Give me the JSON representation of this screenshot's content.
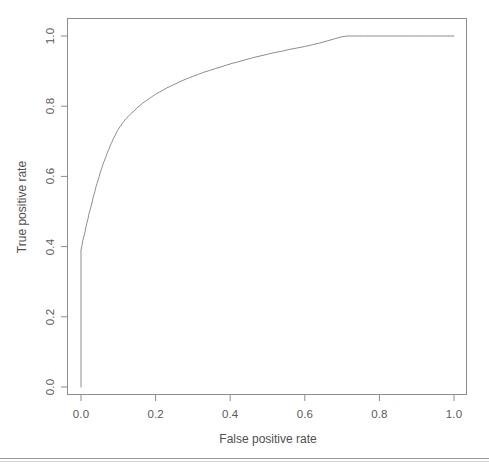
{
  "chart_data": {
    "type": "line",
    "title": "",
    "xlabel": "False positive rate",
    "ylabel": "True positive rate",
    "xlim": [
      0.0,
      1.0
    ],
    "ylim": [
      0.0,
      1.0
    ],
    "grid": false,
    "legend": null,
    "xticks": [
      "0.0",
      "0.2",
      "0.4",
      "0.6",
      "0.8",
      "1.0"
    ],
    "xtick_values": [
      0.0,
      0.2,
      0.4,
      0.6,
      0.8,
      1.0
    ],
    "yticks": [
      "0.0",
      "0.2",
      "0.4",
      "0.6",
      "0.8",
      "1.0"
    ],
    "ytick_values": [
      0.0,
      0.2,
      0.4,
      0.6,
      0.8,
      1.0
    ],
    "series": [
      {
        "name": "ROC curve",
        "color": "#8d8d8d",
        "line_width": 1,
        "x": [
          0.0,
          0.0,
          0.003,
          0.005,
          0.008,
          0.011,
          0.013,
          0.016,
          0.019,
          0.021,
          0.024,
          0.027,
          0.03,
          0.032,
          0.035,
          0.038,
          0.04,
          0.043,
          0.046,
          0.049,
          0.051,
          0.054,
          0.057,
          0.059,
          0.062,
          0.065,
          0.068,
          0.07,
          0.073,
          0.076,
          0.078,
          0.081,
          0.084,
          0.086,
          0.089,
          0.092,
          0.095,
          0.097,
          0.1,
          0.105,
          0.11,
          0.115,
          0.12,
          0.126,
          0.131,
          0.136,
          0.142,
          0.15,
          0.158,
          0.166,
          0.174,
          0.182,
          0.19,
          0.2,
          0.21,
          0.22,
          0.23,
          0.24,
          0.252,
          0.264,
          0.276,
          0.288,
          0.3,
          0.315,
          0.33,
          0.345,
          0.36,
          0.375,
          0.39,
          0.405,
          0.42,
          0.44,
          0.46,
          0.48,
          0.5,
          0.52,
          0.54,
          0.56,
          0.58,
          0.6,
          0.62,
          0.64,
          0.66,
          0.68,
          0.7,
          0.715,
          0.76,
          0.82,
          0.88,
          0.94,
          1.0
        ],
        "y": [
          0.0,
          0.39,
          0.405,
          0.418,
          0.43,
          0.443,
          0.455,
          0.468,
          0.48,
          0.492,
          0.503,
          0.515,
          0.527,
          0.538,
          0.549,
          0.56,
          0.57,
          0.58,
          0.59,
          0.6,
          0.609,
          0.618,
          0.627,
          0.635,
          0.643,
          0.651,
          0.659,
          0.666,
          0.673,
          0.68,
          0.687,
          0.694,
          0.7,
          0.706,
          0.712,
          0.718,
          0.724,
          0.729,
          0.734,
          0.742,
          0.75,
          0.757,
          0.764,
          0.77,
          0.776,
          0.781,
          0.786,
          0.795,
          0.802,
          0.809,
          0.815,
          0.821,
          0.827,
          0.834,
          0.84,
          0.846,
          0.852,
          0.857,
          0.863,
          0.869,
          0.875,
          0.88,
          0.885,
          0.891,
          0.897,
          0.902,
          0.907,
          0.912,
          0.917,
          0.922,
          0.926,
          0.932,
          0.938,
          0.943,
          0.948,
          0.953,
          0.957,
          0.962,
          0.966,
          0.97,
          0.975,
          0.98,
          0.986,
          0.992,
          0.998,
          1.0,
          1.0,
          1.0,
          1.0,
          1.0,
          1.0
        ]
      }
    ]
  },
  "axes": {
    "x_title": "False positive rate",
    "y_title": "True positive rate",
    "x_tick_labels": [
      "0.0",
      "0.2",
      "0.4",
      "0.6",
      "0.8",
      "1.0"
    ],
    "y_tick_labels": [
      "0.0",
      "0.2",
      "0.4",
      "0.6",
      "0.8",
      "1.0"
    ]
  },
  "colors": {
    "curve": "#8d8d8d",
    "frame": "#8d8d8d",
    "text": "#555555",
    "background": "#ffffff"
  }
}
